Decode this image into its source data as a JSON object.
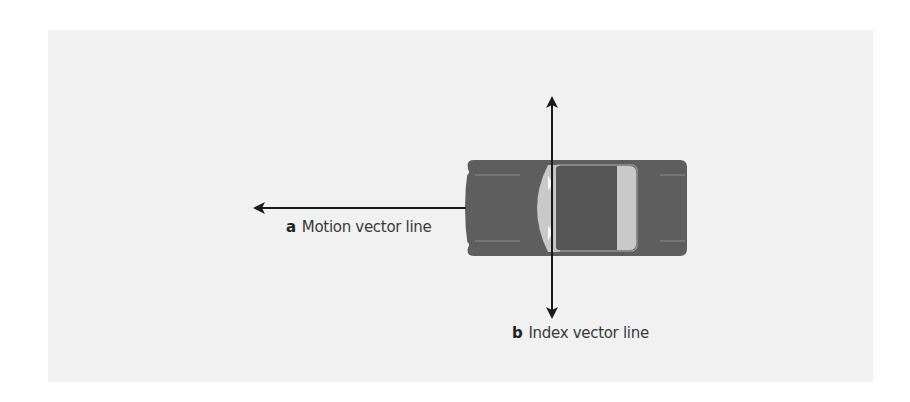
{
  "diagram": {
    "colors": {
      "background": "#ffffff",
      "panel": "#f1f1f1",
      "car_body": "#5e5e5e",
      "car_glass": "#c9c9c9",
      "car_roof": "#565656",
      "arrow": "#1a1a1a"
    },
    "labels": {
      "a": {
        "key": "a",
        "text": "Motion vector line"
      },
      "b": {
        "key": "b",
        "text": "Index vector line"
      }
    },
    "elements": {
      "car": "car-top-view",
      "motion_arrow": "arrow pointing left from car front",
      "index_arrow": "double-headed vertical arrow through car"
    }
  }
}
